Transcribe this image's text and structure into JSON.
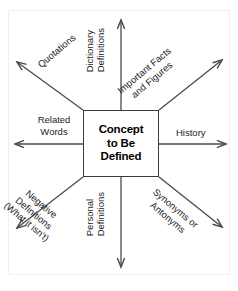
{
  "diagram": {
    "type": "concept-definition-web",
    "center": {
      "lines": [
        "Concept",
        "to Be",
        "Defined"
      ]
    },
    "branches": [
      {
        "id": "dictionary-definitions",
        "direction": "up",
        "lines": [
          "Dictionary",
          "Definitions"
        ]
      },
      {
        "id": "important-facts-and-figures",
        "direction": "up-right",
        "lines": [
          "Important Facts",
          "and Figures"
        ]
      },
      {
        "id": "history",
        "direction": "right",
        "lines": [
          "History"
        ]
      },
      {
        "id": "synonyms-or-antonyms",
        "direction": "down-right",
        "lines": [
          "Synonyms or",
          "Antonyms"
        ]
      },
      {
        "id": "personal-definitions",
        "direction": "down",
        "lines": [
          "Personal",
          "Definitions"
        ]
      },
      {
        "id": "negative-definitions",
        "direction": "down-left",
        "lines": [
          "Negative",
          "Definitions",
          "(What it isn't)"
        ]
      },
      {
        "id": "related-words",
        "direction": "left",
        "lines": [
          "Related",
          "Words"
        ]
      },
      {
        "id": "quotations",
        "direction": "up-left",
        "lines": [
          "Quotations"
        ]
      }
    ],
    "colors": {
      "background": "#ffffff",
      "arrow": "#4a4a4a",
      "box_border": "#3a3a3a",
      "text": "#1c1c1c",
      "frame": "#efefef"
    }
  }
}
